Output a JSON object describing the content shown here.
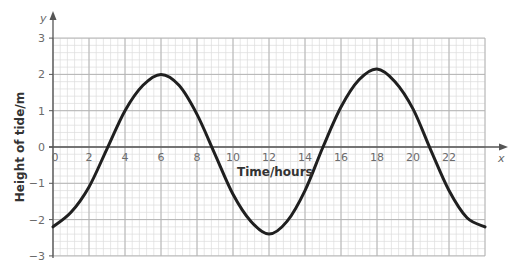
{
  "chart_data": {
    "type": "line",
    "title": "",
    "xlabel": "Time/hours",
    "ylabel": "Height of tide/m",
    "x_axis_name": "x",
    "y_axis_name": "y",
    "xlim": [
      0,
      24
    ],
    "ylim": [
      -3,
      3
    ],
    "x_ticks": [
      "0",
      "2",
      "4",
      "6",
      "8",
      "10",
      "12",
      "14",
      "16",
      "18",
      "20",
      "22"
    ],
    "y_ticks": [
      "3",
      "2",
      "1",
      "0",
      "−1",
      "−2",
      "−3"
    ],
    "grid": true,
    "legend": null,
    "series": [
      {
        "name": "Height of tide",
        "x": [
          0,
          1,
          2,
          3,
          4,
          5,
          6,
          7,
          8,
          9,
          10,
          11,
          12,
          13,
          14,
          15,
          16,
          17,
          18,
          19,
          20,
          21,
          22,
          23,
          24
        ],
        "values": [
          -2.2,
          -1.8,
          -1.1,
          -0.05,
          1.0,
          1.7,
          2.0,
          1.7,
          0.9,
          -0.2,
          -1.3,
          -2.05,
          -2.4,
          -2.05,
          -1.2,
          0.0,
          1.1,
          1.85,
          2.15,
          1.8,
          1.05,
          -0.1,
          -1.2,
          -1.95,
          -2.2
        ]
      }
    ],
    "colors": {
      "curve": "#1f1f1f",
      "grid_minor": "#dcdcdc",
      "grid_major": "#b4b4b4",
      "axis": "#555555"
    }
  }
}
